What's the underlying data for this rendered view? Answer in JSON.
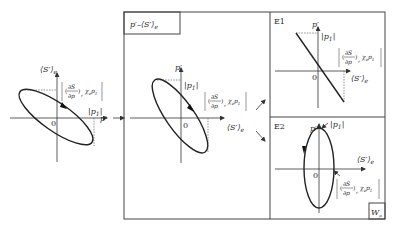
{
  "diagram": {
    "left_panel": {
      "axis_y_label": "⟨S′⟩",
      "axis_y_sub": "e",
      "axis_x_label": "p′",
      "origin_label": "0",
      "amplitude_label": "|p",
      "amplitude_sub": "1",
      "amplitude_close": "|",
      "slope_label_num": "∂S",
      "slope_label_den": "∂p",
      "slope_label_sub": "r",
      "slope_label_tail": "χ",
      "slope_label_tail_sub": "e",
      "slope_label_tail2": "p",
      "slope_label_tail2_sub": "1"
    },
    "middle_panel": {
      "title": "p′–⟨S′⟩",
      "title_sub": "e",
      "axis_y_label": "p′",
      "axis_x_label": "⟨S′⟩",
      "axis_x_sub": "e",
      "origin_label": "0",
      "amplitude_label": "|p",
      "amplitude_sub": "1",
      "amplitude_close": "|",
      "slope_label_num": "∂S",
      "slope_label_den": "∂p",
      "slope_label_sub": "r",
      "slope_label_tail": "χ",
      "slope_label_tail_sub": "e",
      "slope_label_tail2": "p",
      "slope_label_tail2_sub": "1"
    },
    "panel_e1": {
      "tag": "E1",
      "axis_y_label": "p′",
      "axis_x_label": "⟨S′⟩",
      "axis_x_sub": "e",
      "origin_label": "0",
      "amplitude_label": "|p",
      "amplitude_sub": "1",
      "amplitude_close": "|",
      "slope_label_num": "∂S",
      "slope_label_den": "∂p",
      "slope_label_sub": "r",
      "slope_label_tail": "χ",
      "slope_label_tail_sub": "e",
      "slope_label_tail2": "p",
      "slope_label_tail2_sub": "1"
    },
    "panel_e2": {
      "tag": "E2",
      "axis_y_label": "p′",
      "axis_x_label": "⟨S′⟩",
      "axis_x_sub": "e",
      "origin_label": "0",
      "amplitude_label": "|p",
      "amplitude_sub": "1",
      "amplitude_close": "|",
      "slope_label_num": "∂S",
      "slope_label_den": "∂p",
      "slope_label_sub": "r",
      "slope_label_tail": "χ",
      "slope_label_tail_sub": "e",
      "slope_label_tail2": "p",
      "slope_label_tail2_sub": "1",
      "corner_label": "W",
      "corner_sub": "p"
    }
  }
}
